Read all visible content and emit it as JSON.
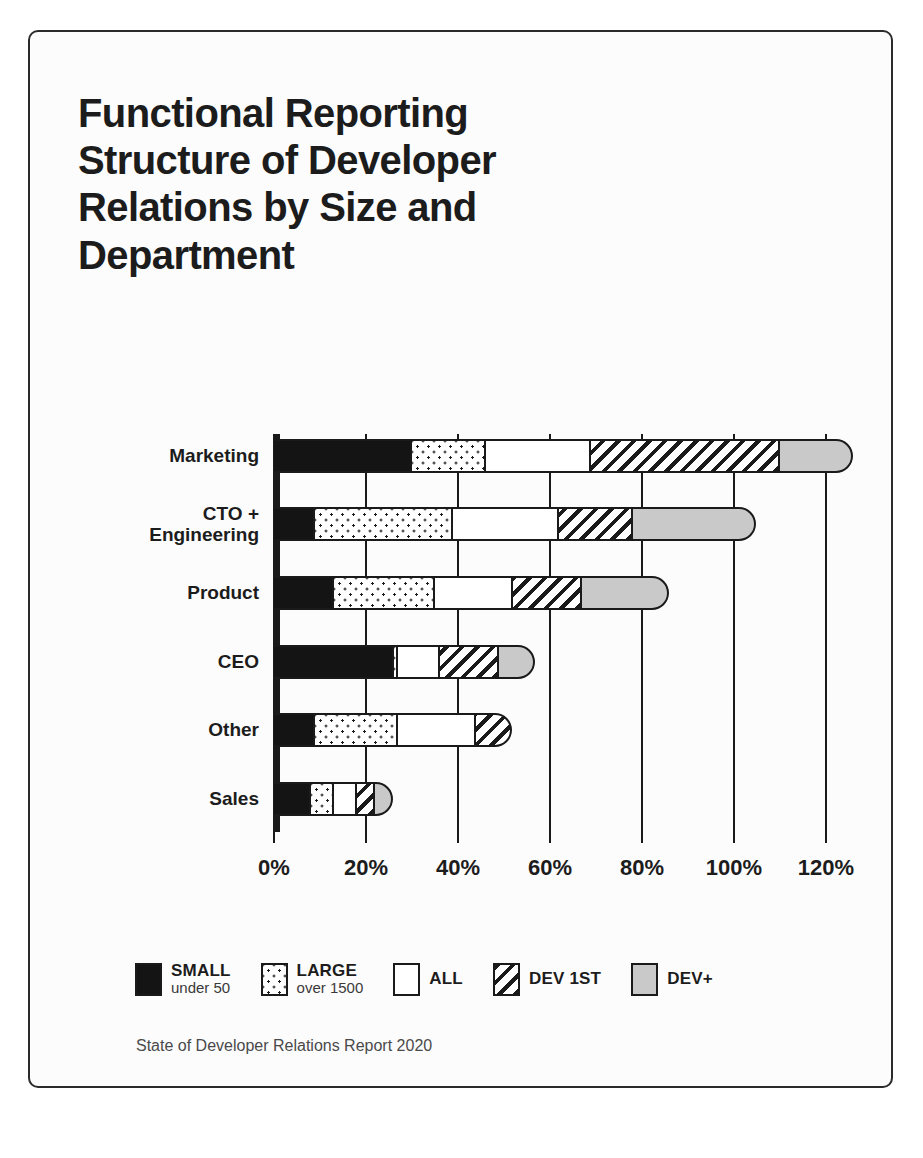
{
  "card": {
    "title": "Functional Reporting\nStructure of Developer\nRelations by Size and\nDepartment",
    "source_note": "State of Developer Relations Report 2020"
  },
  "legend": {
    "items": [
      {
        "key": "small",
        "label": "SMALL",
        "sub": "under 50",
        "swatch": "solid-black-swatch"
      },
      {
        "key": "large",
        "label": "LARGE",
        "sub": "over 1500",
        "swatch": "dotted-swatch"
      },
      {
        "key": "all",
        "label": "ALL",
        "sub": "",
        "swatch": "white-swatch"
      },
      {
        "key": "dev1st",
        "label": "DEV 1ST",
        "sub": "",
        "swatch": "hatched-swatch"
      },
      {
        "key": "devplus",
        "label": "DEV+",
        "sub": "",
        "swatch": "gray-swatch"
      }
    ]
  },
  "chart_data": {
    "type": "bar",
    "orientation": "horizontal",
    "stacked": true,
    "title": "Functional Reporting Structure of Developer Relations by Size and Department",
    "xlabel": "",
    "ylabel": "",
    "xlim": [
      0,
      130
    ],
    "xticks": [
      0,
      20,
      40,
      60,
      80,
      100,
      120
    ],
    "xticklabels": [
      "0%",
      "20%",
      "40%",
      "60%",
      "80%",
      "100%",
      "120%"
    ],
    "grid": true,
    "legend_position": "bottom",
    "categories": [
      "Marketing",
      "CTO +\nEngineering",
      "Product",
      "CEO",
      "Other",
      "Sales"
    ],
    "series": [
      {
        "name": "SMALL",
        "sub": "under 50",
        "values": [
          30,
          9,
          13,
          26,
          9,
          8
        ]
      },
      {
        "name": "LARGE",
        "sub": "over 1500",
        "values": [
          16,
          30,
          22,
          1,
          18,
          5
        ]
      },
      {
        "name": "ALL",
        "sub": "",
        "values": [
          23,
          23,
          17,
          9,
          17,
          5
        ]
      },
      {
        "name": "DEV 1ST",
        "sub": "",
        "values": [
          41,
          16,
          15,
          13,
          8,
          4
        ]
      },
      {
        "name": "DEV+",
        "sub": "",
        "values": [
          16,
          27,
          19,
          8,
          0,
          4
        ]
      }
    ],
    "totals": [
      126,
      105,
      86,
      57,
      52,
      26
    ]
  },
  "colors": {
    "small": "#141414",
    "large": "#ffffff",
    "all": "#ffffff",
    "dev1st": "#ffffff",
    "devplus": "#c9c9c9",
    "outline": "#1a1a1a",
    "background": "#ffffff"
  }
}
